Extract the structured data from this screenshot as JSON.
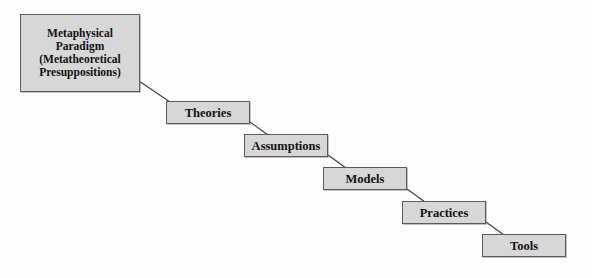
{
  "diagram": {
    "background_color": "#fdfdfd",
    "node_fill_color": "#d7d7d7",
    "node_border_color": "#5a5a5a",
    "text_color": "#111111",
    "nodes": [
      {
        "id": "metaphysical-paradigm",
        "label": "Metaphysical\nParadigm\n(Metatheoretical\nPresuppositions)",
        "level": 0
      },
      {
        "id": "theories",
        "label": "Theories",
        "level": 1
      },
      {
        "id": "assumptions",
        "label": "Assumptions",
        "level": 2
      },
      {
        "id": "models",
        "label": "Models",
        "level": 3
      },
      {
        "id": "practices",
        "label": "Practices",
        "level": 4
      },
      {
        "id": "tools",
        "label": "Tools",
        "level": 5
      }
    ],
    "connectors": [
      {
        "from": "metaphysical-paradigm",
        "to": "theories",
        "x1": 139,
        "y1": 81,
        "x2": 168,
        "y2": 102
      },
      {
        "from": "theories",
        "to": "assumptions",
        "x1": 249,
        "y1": 123,
        "x2": 246,
        "y2": 135
      },
      {
        "from": "assumptions",
        "to": "models",
        "x1": 327,
        "y1": 156,
        "x2": 325,
        "y2": 168
      },
      {
        "from": "models",
        "to": "practices",
        "x1": 406,
        "y1": 189,
        "x2": 404,
        "y2": 202
      },
      {
        "from": "practices",
        "to": "tools",
        "x1": 485,
        "y1": 223,
        "x2": 484,
        "y2": 235
      }
    ]
  }
}
